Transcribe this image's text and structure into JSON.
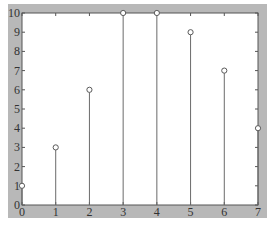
{
  "chart_data": {
    "type": "stem",
    "title": "",
    "xlabel": "",
    "ylabel": "",
    "x": [
      0,
      1,
      2,
      3,
      4,
      5,
      6,
      7
    ],
    "values": [
      1,
      3,
      6,
      10,
      10,
      9,
      7,
      4
    ],
    "xlim": [
      0,
      7
    ],
    "ylim": [
      0,
      10
    ],
    "xticks": [
      "0",
      "1",
      "2",
      "3",
      "4",
      "5",
      "6",
      "7"
    ],
    "yticks": [
      "0",
      "1",
      "2",
      "3",
      "4",
      "5",
      "6",
      "7",
      "8",
      "9",
      "10"
    ],
    "grid": false,
    "legend": null,
    "marker": "open-circle"
  },
  "colors": {
    "frame": "#b8b8b8",
    "plot_background": "#ffffff",
    "stem": "#6a6a6a",
    "marker_edge": "#5a5a5a",
    "text": "#333333"
  }
}
